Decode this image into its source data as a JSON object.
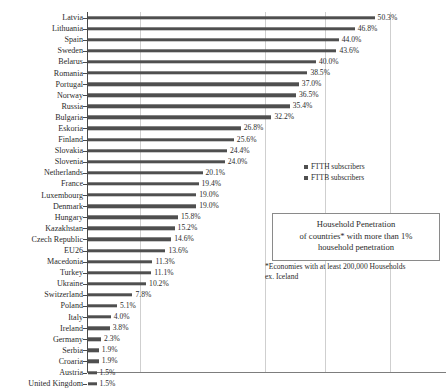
{
  "chart_data": {
    "type": "bar",
    "orientation": "horizontal",
    "title": "Household Penetration of countries* with more than 1% household penetration",
    "xlabel": "",
    "ylabel": "",
    "xlim": [
      0,
      52
    ],
    "grid": true,
    "gridlines_percent": [
      10,
      30,
      40,
      50
    ],
    "legend_position": "right",
    "categories": [
      "Latvia",
      "Lithuania",
      "Spain",
      "Sweden",
      "Belarus",
      "Romania",
      "Portugal",
      "Norway",
      "Russia",
      "Bulgaria",
      "Eskoria",
      "Finland",
      "Slovakia",
      "Slovenia",
      "Netherlands",
      "France",
      "Luxembourg",
      "Denmark",
      "Hungary",
      "Kazakhstan",
      "Czech Republic",
      "EU26",
      "Macedonia",
      "Turkey",
      "Ukraine",
      "Switzerland",
      "Poland",
      "Italy",
      "Ireland",
      "Germany",
      "Serbia",
      "Croaria",
      "Austria",
      "United Kingdom"
    ],
    "values": [
      50.3,
      46.8,
      44.0,
      43.6,
      40.0,
      38.5,
      37.0,
      36.5,
      35.4,
      32.2,
      26.8,
      25.6,
      24.4,
      24.0,
      20.1,
      19.4,
      19.0,
      19.0,
      15.8,
      15.2,
      14.6,
      13.6,
      11.3,
      11.1,
      10.2,
      7.8,
      5.1,
      4.0,
      3.8,
      2.3,
      1.9,
      1.9,
      1.5,
      1.5
    ],
    "value_labels": [
      "50.3%",
      "46.8%",
      "44.0%",
      "43.6%",
      "40.0%",
      "38.5%",
      "37.0%",
      "36.5%",
      "35.4%",
      "32.2%",
      "26.8%",
      "25.6%",
      "24.4%",
      "24.0%",
      "20.1%",
      "19.4%",
      "19.0%",
      "19.0%",
      "15.8%",
      "15.2%",
      "14.6%",
      "13.6%",
      "11.3%",
      "11.1%",
      "10.2%",
      "7.8%",
      "5.1%",
      "4.0%",
      "3.8%",
      "2.3%",
      "1.9%",
      "1.9%",
      "1.5%",
      "1.5%"
    ],
    "series": [
      {
        "name": "FTTH subscribers"
      },
      {
        "name": "FTTB subscribers"
      }
    ],
    "bar_color": "#4f4f4f",
    "grid_color": "#cfcfcf",
    "axis_color": "#4a4a4a"
  },
  "legend": {
    "items": [
      {
        "label": "FTTH subscribers"
      },
      {
        "label": "FTTB subscribers"
      }
    ]
  },
  "caption": {
    "line1": "Household Penetration",
    "line2": "of countries* with more than 1%",
    "line3": "household penetration"
  },
  "footnote": {
    "line1": "*Economies with at least 200,000 Households",
    "line2": "ex. Iceland"
  }
}
